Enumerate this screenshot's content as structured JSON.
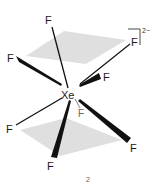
{
  "molecule": {
    "central_atom": "Xe",
    "ligand_symbol": "F",
    "charge": "2−",
    "caption": "2",
    "colors": {
      "bond": "#111111",
      "back_bond": "#888888",
      "plane": "#d9d9d9",
      "text": "#1a1a1a"
    },
    "ligands": [
      {
        "id": "f-top",
        "label": "F"
      },
      {
        "id": "f-upper-left",
        "label": "F"
      },
      {
        "id": "f-upper-right",
        "label": "F"
      },
      {
        "id": "f-mid-right",
        "label": "F"
      },
      {
        "id": "f-back-lower",
        "label": "F"
      },
      {
        "id": "f-lower-left",
        "label": "F"
      },
      {
        "id": "f-bottom",
        "label": "F"
      },
      {
        "id": "f-lower-right",
        "label": "F"
      }
    ]
  }
}
